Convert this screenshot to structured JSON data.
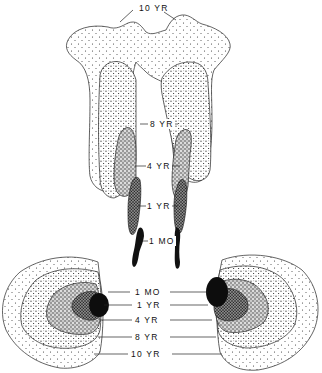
{
  "figure": {
    "colors": {
      "ink": "#111111",
      "background": "#ffffff"
    },
    "upper_structure": {
      "labels": {
        "ten_yr": "10 YR",
        "eight_yr": "8 YR",
        "four_yr": "4 YR",
        "one_yr": "1 YR",
        "one_mo": "1 MO"
      }
    },
    "lower_structure": {
      "labels": [
        {
          "id": "1mo",
          "text": "1 MO"
        },
        {
          "id": "1yr",
          "text": "1 YR"
        },
        {
          "id": "4yr",
          "text": "4 YR"
        },
        {
          "id": "8yr",
          "text": "8 YR"
        },
        {
          "id": "10yr",
          "text": "10 YR"
        }
      ]
    },
    "legend_order": [
      "1 MO",
      "1 YR",
      "4 YR",
      "8 YR",
      "10 YR"
    ]
  }
}
